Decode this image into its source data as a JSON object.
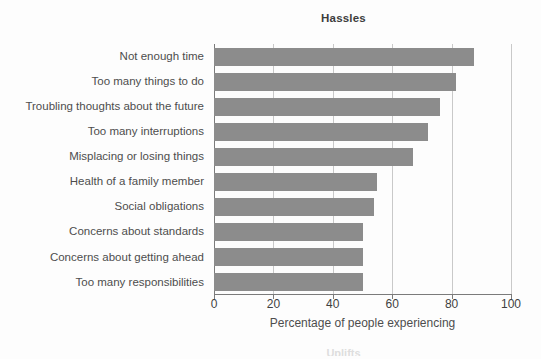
{
  "chart_data": {
    "type": "bar",
    "orientation": "horizontal",
    "title": "Hassles",
    "xlabel": "Percentage of people experiencing",
    "ylabel": "",
    "xlim": [
      0,
      100
    ],
    "xticks": [
      "0",
      "20",
      "40",
      "60",
      "80",
      "100"
    ],
    "xtick_values": [
      0,
      20,
      40,
      60,
      80,
      100
    ],
    "grid": "vertical",
    "legend": "none",
    "bar_color": "#8c8c8c",
    "categories": [
      "Not enough time",
      "Too many things to do",
      "Troubling thoughts about the future",
      "Too many interruptions",
      "Misplacing or losing things",
      "Health of a family member",
      "Social obligations",
      "Concerns about standards",
      "Concerns about getting ahead",
      "Too many responsibilities"
    ],
    "values": [
      87.5,
      81.5,
      76,
      72,
      67,
      55,
      54,
      50,
      50,
      50
    ]
  },
  "next_figure": {
    "clipped_title": "Uplifts"
  }
}
